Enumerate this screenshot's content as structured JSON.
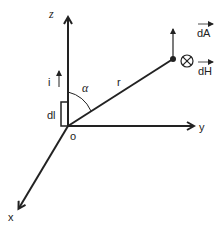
{
  "diagram": {
    "type": "biot-savart-3d-axes",
    "axes": {
      "z": "z",
      "y": "y",
      "x": "x",
      "origin": "o"
    },
    "labels": {
      "current": "i",
      "element": "dl",
      "angle": "α",
      "distance": "r",
      "dA": "dA",
      "dH": "dH"
    },
    "colors": {
      "stroke": "#222222",
      "background": "#ffffff"
    }
  }
}
